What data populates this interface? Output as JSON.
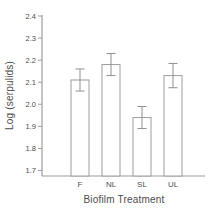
{
  "figure": {
    "background_color": "#ffffff",
    "text_color": "#4d4d4d",
    "axis_line_color": "#9e9e9e",
    "error_bar_color": "#8f8f8f"
  },
  "chart_data": {
    "type": "bar",
    "title": "",
    "xlabel": "Biofilm Treatment",
    "ylabel": "Log (serpulids)",
    "categories": [
      "F",
      "NL",
      "SL",
      "UL"
    ],
    "values": [
      2.11,
      2.18,
      1.94,
      2.13
    ],
    "error_bars": [
      0.05,
      0.05,
      0.05,
      0.055
    ],
    "ylim": [
      1.675,
      2.4
    ],
    "yticks": [
      1.7,
      1.8,
      1.9,
      2.0,
      2.1,
      2.2,
      2.3,
      2.4
    ],
    "ytick_format_decimals": 1,
    "grid": false,
    "legend": false,
    "bar_fill": "#ffffff",
    "bar_stroke": "#9e9e9e"
  }
}
